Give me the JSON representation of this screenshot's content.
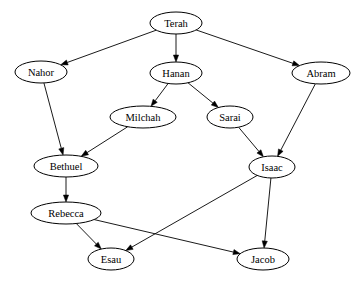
{
  "diagram": {
    "type": "directed-graph",
    "colors": {
      "background": "#ffffff",
      "stroke": "#000000",
      "text": "#000000",
      "node_fill": "#ffffff"
    },
    "nodes": [
      {
        "id": "Terah",
        "label": "Terah",
        "cx": 176,
        "cy": 23,
        "rx": 26,
        "ry": 11
      },
      {
        "id": "Nahor",
        "label": "Nahor",
        "cx": 41,
        "cy": 72,
        "rx": 26,
        "ry": 11
      },
      {
        "id": "Hanan",
        "label": "Hanan",
        "cx": 176,
        "cy": 73,
        "rx": 26,
        "ry": 11
      },
      {
        "id": "Abram",
        "label": "Abram",
        "cx": 321,
        "cy": 73,
        "rx": 29,
        "ry": 11
      },
      {
        "id": "Milchah",
        "label": "Milchah",
        "cx": 143,
        "cy": 117,
        "rx": 33,
        "ry": 11
      },
      {
        "id": "Sarai",
        "label": "Sarai",
        "cx": 230,
        "cy": 117,
        "rx": 23,
        "ry": 11
      },
      {
        "id": "Bethuel",
        "label": "Bethuel",
        "cx": 66,
        "cy": 166,
        "rx": 32,
        "ry": 11
      },
      {
        "id": "Isaac",
        "label": "Isaac",
        "cx": 272,
        "cy": 167,
        "rx": 23,
        "ry": 11
      },
      {
        "id": "Rebecca",
        "label": "Rebecca",
        "cx": 66,
        "cy": 213,
        "rx": 35,
        "ry": 11
      },
      {
        "id": "Esau",
        "label": "Esau",
        "cx": 111,
        "cy": 259,
        "rx": 23,
        "ry": 11
      },
      {
        "id": "Jacob",
        "label": "Jacob",
        "cx": 263,
        "cy": 259,
        "rx": 26,
        "ry": 11
      }
    ],
    "edges": [
      {
        "from": "Terah",
        "to": "Nahor"
      },
      {
        "from": "Terah",
        "to": "Hanan"
      },
      {
        "from": "Terah",
        "to": "Abram"
      },
      {
        "from": "Nahor",
        "to": "Bethuel"
      },
      {
        "from": "Hanan",
        "to": "Milchah"
      },
      {
        "from": "Hanan",
        "to": "Sarai"
      },
      {
        "from": "Milchah",
        "to": "Bethuel"
      },
      {
        "from": "Sarai",
        "to": "Isaac"
      },
      {
        "from": "Abram",
        "to": "Isaac"
      },
      {
        "from": "Bethuel",
        "to": "Rebecca"
      },
      {
        "from": "Isaac",
        "to": "Esau"
      },
      {
        "from": "Isaac",
        "to": "Jacob"
      },
      {
        "from": "Rebecca",
        "to": "Esau"
      },
      {
        "from": "Rebecca",
        "to": "Jacob"
      }
    ]
  }
}
